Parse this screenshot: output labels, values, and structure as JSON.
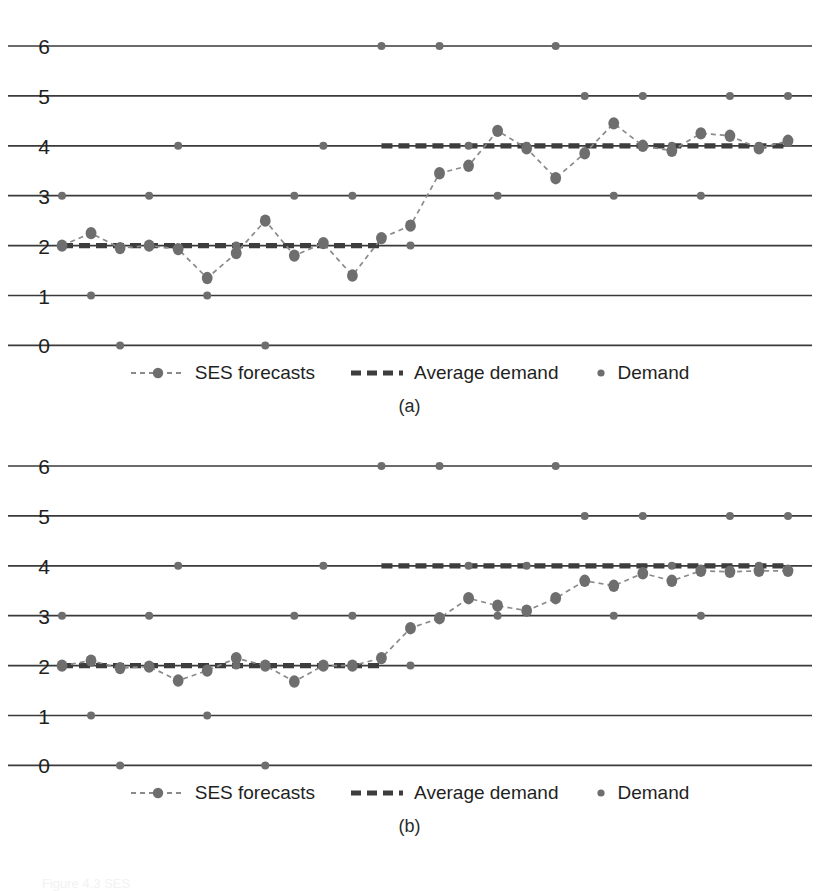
{
  "figure": {
    "caption": "Figure 4.3   SES",
    "panels": [
      {
        "id": "a",
        "caption": "(a)"
      },
      {
        "id": "b",
        "caption": "(b)"
      }
    ]
  },
  "legend": {
    "items": [
      {
        "key": "ses",
        "label": "SES forecasts",
        "symbol": "dashed-line-with-marker"
      },
      {
        "key": "avg",
        "label": "Average demand",
        "symbol": "thick-dashed-line"
      },
      {
        "key": "demand",
        "label": "Demand",
        "symbol": "dot-marker"
      }
    ]
  },
  "colors": {
    "marker": "#6e6e6e",
    "ses_line": "#8a8a8a",
    "average_line": "#3d3d3d",
    "gridline": "#3a3a3a",
    "text": "#1f1f1f",
    "background": "#ffffff"
  },
  "chart_data": [
    {
      "type": "line",
      "id": "a",
      "title": "(a)",
      "xlabel": "",
      "ylabel": "",
      "ylim": [
        0,
        6
      ],
      "yticks": [
        0,
        1,
        2,
        3,
        4,
        5,
        6
      ],
      "ticklabels": [
        "0",
        "1",
        "2",
        "3",
        "4",
        "5",
        "6"
      ],
      "grid": true,
      "legend_position": "bottom",
      "x": [
        1,
        2,
        3,
        4,
        5,
        6,
        7,
        8,
        9,
        10,
        11,
        12,
        13,
        14,
        15,
        16,
        17,
        18,
        19,
        20,
        21,
        22,
        23,
        24,
        25,
        26
      ],
      "series": [
        {
          "name": "Demand",
          "type": "scatter",
          "values": [
            3,
            1,
            0,
            3,
            4,
            1,
            2,
            0,
            3,
            4,
            3,
            6,
            2,
            6,
            4,
            3,
            4,
            6,
            5,
            3,
            5,
            4,
            3,
            5,
            4,
            5
          ]
        },
        {
          "name": "SES forecasts",
          "type": "line",
          "values": [
            2.0,
            2.25,
            1.95,
            2.0,
            1.93,
            1.35,
            1.85,
            2.5,
            1.8,
            2.05,
            1.4,
            2.15,
            2.4,
            3.45,
            3.6,
            4.3,
            3.95,
            3.35,
            3.85,
            4.45,
            4.0,
            3.9,
            4.25,
            4.2,
            3.95,
            4.1
          ]
        },
        {
          "name": "Average demand",
          "type": "step",
          "segments": [
            {
              "from_x": 1,
              "to_x": 12,
              "value": 2.0
            },
            {
              "from_x": 12,
              "to_x": 26,
              "value": 4.0
            }
          ]
        }
      ]
    },
    {
      "type": "line",
      "id": "b",
      "title": "(b)",
      "xlabel": "",
      "ylabel": "",
      "ylim": [
        0,
        6
      ],
      "yticks": [
        0,
        1,
        2,
        3,
        4,
        5,
        6
      ],
      "ticklabels": [
        "0",
        "1",
        "2",
        "3",
        "4",
        "5",
        "6"
      ],
      "grid": true,
      "legend_position": "bottom",
      "x": [
        1,
        2,
        3,
        4,
        5,
        6,
        7,
        8,
        9,
        10,
        11,
        12,
        13,
        14,
        15,
        16,
        17,
        18,
        19,
        20,
        21,
        22,
        23,
        24,
        25,
        26
      ],
      "series": [
        {
          "name": "Demand",
          "type": "scatter",
          "values": [
            3,
            1,
            0,
            3,
            4,
            1,
            2,
            0,
            3,
            4,
            3,
            6,
            2,
            6,
            4,
            3,
            4,
            6,
            5,
            3,
            5,
            4,
            3,
            5,
            4,
            5
          ]
        },
        {
          "name": "SES forecasts",
          "type": "line",
          "values": [
            2.0,
            2.1,
            1.95,
            1.98,
            1.7,
            1.9,
            2.15,
            2.0,
            1.68,
            2.0,
            2.0,
            2.15,
            2.75,
            2.95,
            3.35,
            3.2,
            3.1,
            3.35,
            3.7,
            3.6,
            3.85,
            3.7,
            3.9,
            3.88,
            3.9,
            3.9
          ]
        },
        {
          "name": "Average demand",
          "type": "step",
          "segments": [
            {
              "from_x": 1,
              "to_x": 12,
              "value": 2.0
            },
            {
              "from_x": 12,
              "to_x": 26,
              "value": 4.0
            }
          ]
        }
      ]
    }
  ]
}
